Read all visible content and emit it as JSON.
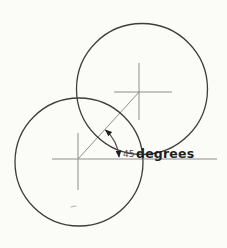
{
  "palette": {
    "paper": "#fbfbf8",
    "circle_stroke": "#3d3d3d",
    "guide_stroke": "#8e8e8e",
    "arc_stroke": "#4f4f4f",
    "arrow_fill": "#1e1e1e",
    "value_text": "#4a4a4a",
    "unit_text": "#1f1f1f",
    "speck": "#b5b5af"
  },
  "annotation": {
    "angle_value": "45",
    "angle_unit": "degrees",
    "full_label": "45 degrees"
  },
  "diagram": {
    "canvas": {
      "width": 227,
      "height": 248
    },
    "circles": {
      "upper": {
        "cx": 142,
        "cy": 89,
        "r": 65.5
      },
      "lower": {
        "cx": 79,
        "cy": 162,
        "r": 64
      }
    },
    "lines": {
      "lower_crosshair_vertical": {
        "x1": 78,
        "y1": 133,
        "x2": 78,
        "y2": 190
      },
      "baseline_horizontal": {
        "x1": 52,
        "y1": 159,
        "x2": 217,
        "y2": 159
      },
      "upper_crosshair_vertical": {
        "x1": 139,
        "y1": 63,
        "x2": 139,
        "y2": 120
      },
      "upper_crosshair_horizontal": {
        "x1": 114,
        "y1": 92,
        "x2": 172,
        "y2": 92
      },
      "rotation_diagonal": {
        "x1": 78,
        "y1": 159,
        "x2": 140,
        "y2": 91
      }
    },
    "angle_arc": {
      "d": "M 119 157 A 40.5 40.5 0 0 0 105.5 130"
    },
    "speck": {
      "x1": 71,
      "y1": 207,
      "x2": 76,
      "y2": 206
    },
    "labels": {
      "angle_value_pos": {
        "x": 123,
        "y": 157
      },
      "angle_unit_pos": {
        "x": 136,
        "y": 158
      }
    }
  }
}
